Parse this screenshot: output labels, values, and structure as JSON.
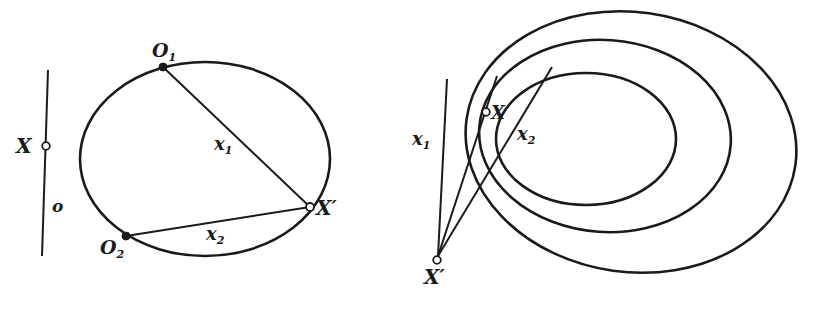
{
  "figure_left": {
    "line_label": "o",
    "point_X_label": "X",
    "point_O1": {
      "base": "O",
      "sub": "1"
    },
    "point_O2": {
      "base": "O",
      "sub": "2"
    },
    "point_Xprime_label": "X′",
    "chord_x1": {
      "base": "x",
      "sub": "1"
    },
    "chord_x2": {
      "base": "x",
      "sub": "2"
    }
  },
  "figure_right": {
    "line_x1": {
      "base": "x",
      "sub": "1"
    },
    "line_x2": {
      "base": "x",
      "sub": "2"
    },
    "point_X_label": "X",
    "point_Xprime_label": "X′",
    "ellipse_count": 3
  },
  "colors": {
    "ink": "#1a1a1a",
    "background": "#ffffff"
  }
}
